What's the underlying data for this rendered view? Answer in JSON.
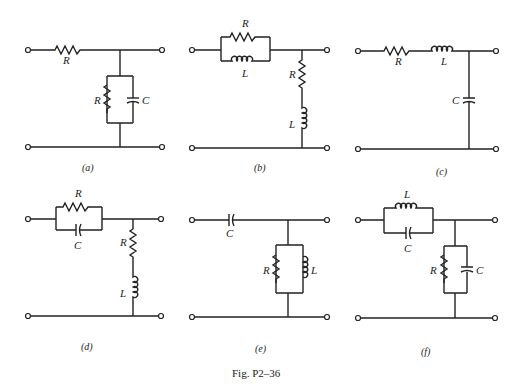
{
  "figure": {
    "caption": "Fig. P2–36",
    "circuits": [
      {
        "id": "a",
        "label": "(a)",
        "series": [
          "R"
        ],
        "shunt": "R ∥ C",
        "labels": {
          "series_r": "R",
          "shunt_r": "R",
          "shunt_c": "C"
        }
      },
      {
        "id": "b",
        "label": "(b)",
        "series": [
          "R ∥ L"
        ],
        "shunt": "R + L",
        "labels": {
          "series_r": "R",
          "series_l": "L",
          "shunt_r": "R",
          "shunt_l": "L"
        }
      },
      {
        "id": "c",
        "label": "(c)",
        "series": [
          "R",
          "L"
        ],
        "shunt": "C",
        "labels": {
          "series_r": "R",
          "series_l": "L",
          "shunt_c": "C"
        }
      },
      {
        "id": "d",
        "label": "(d)",
        "series": [
          "R ∥ C"
        ],
        "shunt": "R + L",
        "labels": {
          "series_r": "R",
          "series_c": "C",
          "shunt_r": "R",
          "shunt_l": "L"
        }
      },
      {
        "id": "e",
        "label": "(e)",
        "series": [
          "C"
        ],
        "shunt": "R ∥ L",
        "labels": {
          "series_c": "C",
          "shunt_r": "R",
          "shunt_l": "L"
        }
      },
      {
        "id": "f",
        "label": "(f)",
        "series": [
          "L ∥ C"
        ],
        "shunt": "R ∥ C",
        "labels": {
          "series_l": "L",
          "series_c": "C",
          "shunt_r": "R",
          "shunt_c": "C"
        }
      }
    ]
  }
}
